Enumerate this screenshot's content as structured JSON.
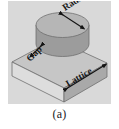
{
  "figure": {
    "caption": "(a)",
    "panel_background": "#d9d9d9",
    "labels": {
      "radius": "Radius",
      "gap": "Gap",
      "lattice": "Lattice"
    },
    "colors": {
      "disk_top": "#b4b4b4",
      "disk_side": "#9a9a9a",
      "slab_top": "#c6c6c6",
      "slab_front_left": "#dcdcdc",
      "slab_front_right": "#a8a8a8",
      "outline": "#4a4a4a",
      "arrow": "#1a1a1a"
    },
    "geometry": {
      "type": "3d-unit-cell-schematic",
      "parts": [
        "cylinder-disk",
        "square-slab"
      ],
      "dimensions_annotated": [
        "Radius",
        "Gap",
        "Lattice"
      ]
    }
  }
}
